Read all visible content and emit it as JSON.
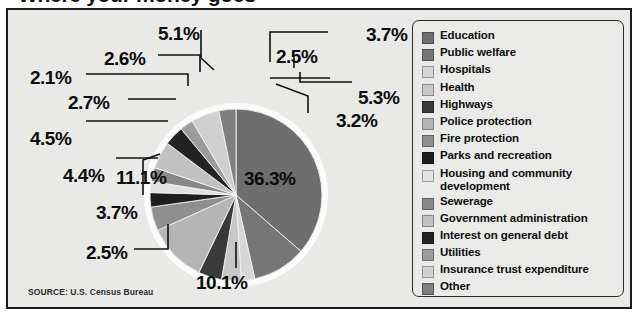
{
  "title": "Where your money goes",
  "source": "SOURCE: U.S. Census Bureau",
  "legend": {
    "items": [
      {
        "label": "Education",
        "color": "#6e6e6e"
      },
      {
        "label": "Public welfare",
        "color": "#767676"
      },
      {
        "label": "Hospitals",
        "color": "#d6d6d6"
      },
      {
        "label": "Health",
        "color": "#c7c7c7"
      },
      {
        "label": "Highways",
        "color": "#3a3a3a"
      },
      {
        "label": "Police protection",
        "color": "#b5b5b5"
      },
      {
        "label": "Fire protection",
        "color": "#8f8f8f"
      },
      {
        "label": "Parks and recreation",
        "color": "#1e1e1e"
      },
      {
        "label": "Housing and community",
        "label2": "development",
        "color": "#e2e2e2"
      },
      {
        "label": "Sewerage",
        "color": "#888888"
      },
      {
        "label": "Government administration",
        "color": "#c2c2c2"
      },
      {
        "label": "Interest on general debt",
        "color": "#232323"
      },
      {
        "label": "Utilities",
        "color": "#9c9c9c"
      },
      {
        "label": "Insurance trust expenditure",
        "color": "#cfcfcf"
      },
      {
        "label": "Other",
        "color": "#7f7f7f"
      }
    ]
  },
  "labels": [
    {
      "text": "5.1%",
      "x": 150,
      "y": 13
    },
    {
      "text": "2.6%",
      "x": 96,
      "y": 38
    },
    {
      "text": "2.1%",
      "x": 22,
      "y": 57
    },
    {
      "text": "2.7%",
      "x": 60,
      "y": 82
    },
    {
      "text": "4.5%",
      "x": 22,
      "y": 118
    },
    {
      "text": "4.4%",
      "x": 55,
      "y": 155
    },
    {
      "text": "3.7%",
      "x": 88,
      "y": 192
    },
    {
      "text": "2.5%",
      "x": 78,
      "y": 232
    },
    {
      "text": "10.1%",
      "x": 188,
      "y": 262
    },
    {
      "text": "11.1%",
      "x": 108,
      "y": 157
    },
    {
      "text": "36.3%",
      "x": 236,
      "y": 158
    },
    {
      "text": "3.2%",
      "x": 328,
      "y": 100
    },
    {
      "text": "5.3%",
      "x": 350,
      "y": 77
    },
    {
      "text": "2.5%",
      "x": 268,
      "y": 36
    },
    {
      "text": "3.7%",
      "x": 358,
      "y": 14
    }
  ],
  "chart_data": {
    "type": "pie",
    "title": "Where your money goes",
    "source": "SOURCE: U.S. Census Bureau",
    "unit": "percent",
    "start_angle_deg": 0,
    "direction": "clockwise",
    "categories": [
      "Education",
      "Public welfare",
      "Hospitals",
      "Health",
      "Highways",
      "Police protection",
      "Fire protection",
      "Parks and recreation",
      "Housing and community development",
      "Sewerage",
      "Government administration",
      "Interest on general debt",
      "Utilities",
      "Insurance trust expenditure",
      "Other"
    ],
    "values": [
      36.3,
      10.1,
      2.5,
      3.7,
      4.4,
      11.1,
      4.5,
      2.7,
      2.1,
      2.6,
      5.1,
      3.7,
      2.5,
      5.3,
      3.2
    ],
    "colors": [
      "#6e6e6e",
      "#767676",
      "#d6d6d6",
      "#c7c7c7",
      "#3a3a3a",
      "#b5b5b5",
      "#8f8f8f",
      "#1e1e1e",
      "#e2e2e2",
      "#888888",
      "#c2c2c2",
      "#232323",
      "#9c9c9c",
      "#cfcfcf",
      "#7f7f7f"
    ],
    "total": 99.8,
    "legend_position": "right",
    "grid": false
  }
}
